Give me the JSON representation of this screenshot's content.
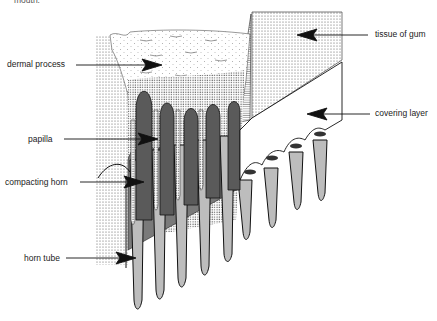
{
  "figure": {
    "top_cut_text": "mouth.",
    "labels": {
      "dermal_process": "dermal process",
      "papilla": "papilla",
      "compacting_horn": "compacting horn",
      "horn_tube": "horn tube",
      "tissue_of_gum": "tissue of gum",
      "covering_layer": "covering layer"
    },
    "colors": {
      "papilla_dark": "#5a5a5a",
      "horn_light": "#bdbdbd",
      "compacting_mid": "#7a7a7a",
      "stipple": "#444444",
      "line": "#111111",
      "background": "#ffffff"
    }
  }
}
